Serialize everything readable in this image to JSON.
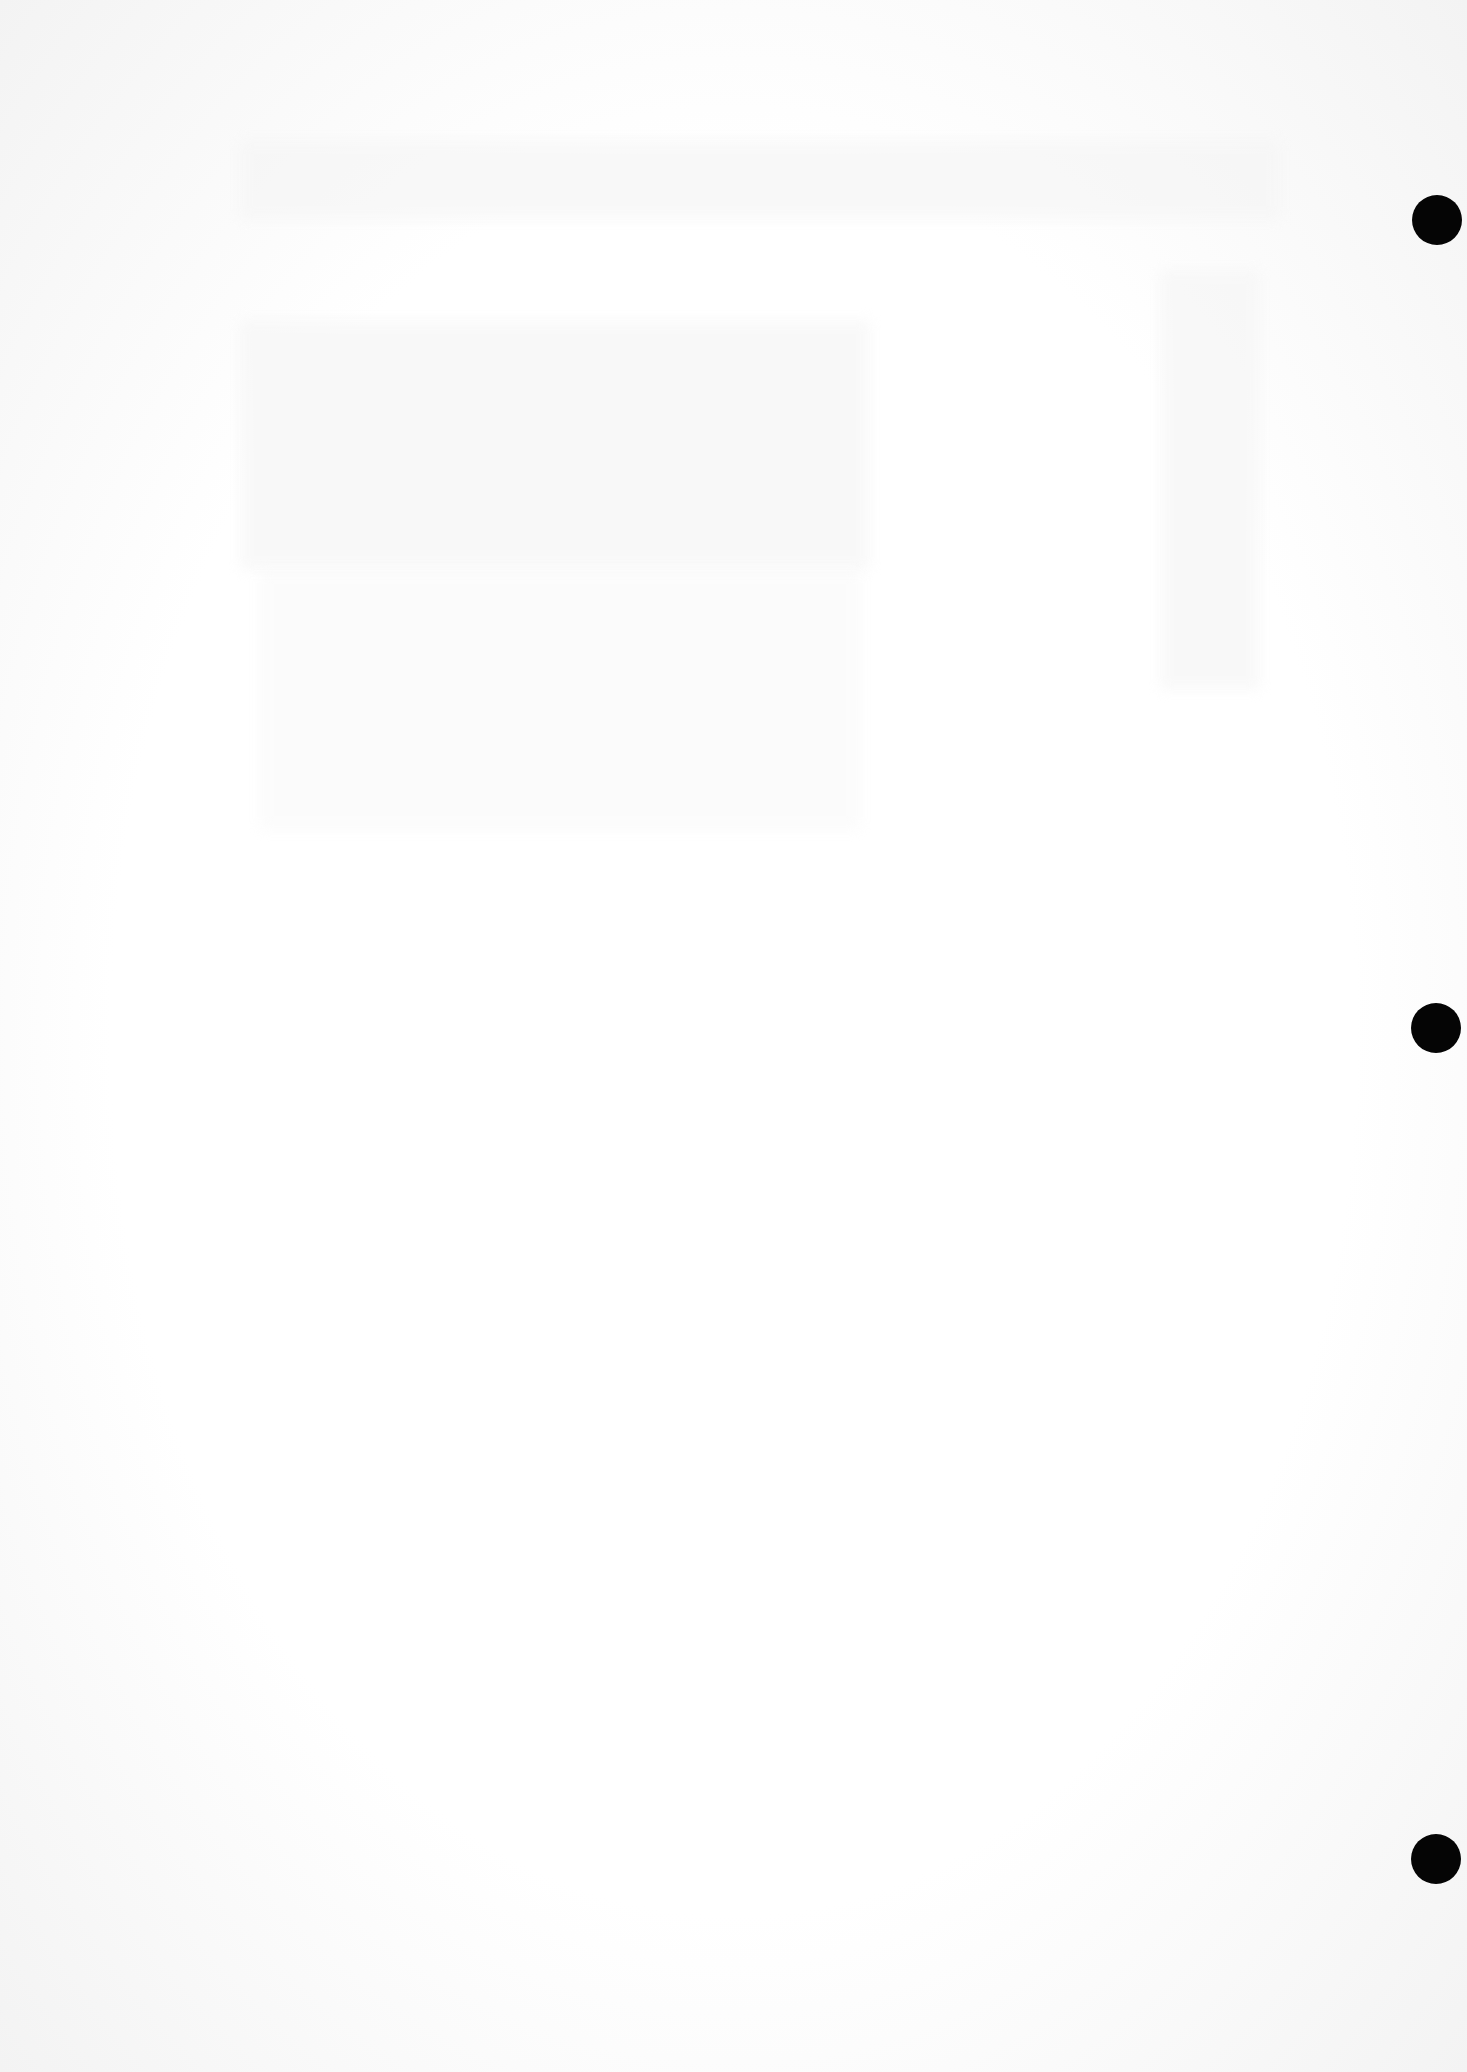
{
  "page": {
    "type": "scanned-blank-page",
    "background_color": "#ffffff",
    "hole_color": "#050505",
    "punch_holes": [
      {
        "label": "top",
        "top": 195,
        "left": 1412
      },
      {
        "label": "middle",
        "top": 1003,
        "left": 1411
      },
      {
        "label": "bottom",
        "top": 1834,
        "left": 1411
      }
    ]
  }
}
